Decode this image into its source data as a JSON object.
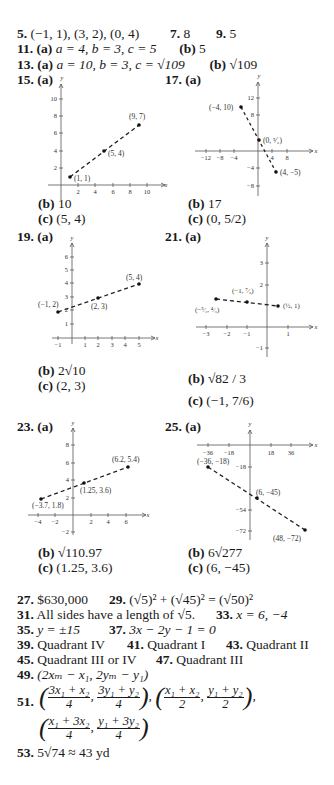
{
  "answers": {
    "a5": {
      "num": "5.",
      "text": "(−1, 1), (3, 2), (0, 4)"
    },
    "a7": {
      "num": "7.",
      "text": "8"
    },
    "a9": {
      "num": "9.",
      "text": "5"
    },
    "a11": {
      "num": "11.",
      "a_label": "(a)",
      "a_text": "a = 4, b = 3, c = 5",
      "b_label": "(b)",
      "b_text": "5"
    },
    "a13": {
      "num": "13.",
      "a_label": "(a)",
      "a_text": "a = 10, b = 3, c = √109",
      "b_label": "(b)",
      "b_text": "√109"
    },
    "a15": {
      "num": "15.",
      "a_label": "(a)",
      "b_label": "(b)",
      "b_text": "10",
      "c_label": "(c)",
      "c_text": "(5, 4)"
    },
    "a17": {
      "num": "17.",
      "a_label": "(a)",
      "b_label": "(b)",
      "b_text": "17",
      "c_label": "(c)",
      "c_text": "(0, 5/2)"
    },
    "a19": {
      "num": "19.",
      "a_label": "(a)",
      "b_label": "(b)",
      "b_text": "2√10",
      "c_label": "(c)",
      "c_text": "(2, 3)"
    },
    "a21": {
      "num": "21.",
      "a_label": "(a)",
      "b_label": "(b)",
      "b_text": "√82 / 3",
      "c_label": "(c)",
      "c_text": "(−1, 7/6)"
    },
    "a23": {
      "num": "23.",
      "a_label": "(a)",
      "b_label": "(b)",
      "b_text": "√110.97",
      "c_label": "(c)",
      "c_text": "(1.25, 3.6)"
    },
    "a25": {
      "num": "25.",
      "a_label": "(a)",
      "b_label": "(b)",
      "b_text": "6√277",
      "c_label": "(c)",
      "c_text": "(6, −45)"
    },
    "a27": {
      "num": "27.",
      "text": "$630,000"
    },
    "a29": {
      "num": "29.",
      "text": "(√5)² + (√45)² = (√50)²"
    },
    "a31": {
      "num": "31.",
      "text": "All sides have a length of √5."
    },
    "a33": {
      "num": "33.",
      "text": "x = 6, −4"
    },
    "a35": {
      "num": "35.",
      "text": "y = ±15"
    },
    "a37": {
      "num": "37.",
      "text": "3x − 2y − 1 = 0"
    },
    "a39": {
      "num": "39.",
      "text": "Quadrant IV"
    },
    "a41": {
      "num": "41.",
      "text": "Quadrant I"
    },
    "a43": {
      "num": "43.",
      "text": "Quadrant II"
    },
    "a45": {
      "num": "45.",
      "text": "Quadrant III or IV"
    },
    "a47": {
      "num": "47.",
      "text": "Quadrant III"
    },
    "a49": {
      "num": "49.",
      "text": "(2xₘ − x₁, 2yₘ − y₁)"
    },
    "a51": {
      "num": "51.",
      "text": "((3x₁ + x₂)/4, (3y₁ + y₂)/4), ((x₁ + x₂)/2, (y₁ + y₂)/2), ((x₁ + 3x₂)/4, (y₁ + 3y₂)/4)"
    },
    "a53": {
      "num": "53.",
      "text": "5√74 ≈ 43 yd"
    }
  },
  "graphs": {
    "g15": {
      "points": [
        "(1, 1)",
        "(5, 4)",
        "(9, 7)"
      ],
      "xticks": [
        "2",
        "4",
        "6",
        "8",
        "10"
      ],
      "yticks": [
        "2",
        "4",
        "6",
        "8",
        "10"
      ],
      "xaxis": "x",
      "yaxis": "y"
    },
    "g17": {
      "points": [
        "(−4, 10)",
        "(0, 5/2)",
        "(4, −5)"
      ],
      "xticks": [
        "−12",
        "−8",
        "−4",
        "4",
        "8"
      ],
      "yticks": [
        "12",
        "8",
        "−4",
        "−8"
      ],
      "xaxis": "x",
      "yaxis": "y"
    },
    "g19": {
      "points": [
        "(−1, 2)",
        "(2, 3)",
        "(5, 4)"
      ],
      "xticks": [
        "−1",
        "1",
        "2",
        "3",
        "4",
        "5"
      ],
      "yticks": [
        "1",
        "2",
        "3",
        "4",
        "5",
        "6"
      ],
      "xaxis": "x",
      "yaxis": "y"
    },
    "g21": {
      "points": [
        "(−5/2, 4/3)",
        "(−1, 7/6)",
        "(1/2, 1)"
      ],
      "xticks": [
        "−3",
        "−2",
        "−1",
        "1"
      ],
      "yticks": [
        "3",
        "2",
        "−1"
      ],
      "xaxis": "x",
      "yaxis": "y"
    },
    "g23": {
      "points": [
        "(−3.7, 1.8)",
        "(1.25, 3.6)",
        "(6.2, 5.4)"
      ],
      "xticks": [
        "−4",
        "−2",
        "2",
        "4",
        "6"
      ],
      "yticks": [
        "8",
        "6",
        "4",
        "2",
        "−2"
      ],
      "xaxis": "x",
      "yaxis": "y"
    },
    "g25": {
      "points": [
        "(−36, −18)",
        "(6, −45)",
        "(48, −72)"
      ],
      "xticks": [
        "−36",
        "−18",
        "18",
        "36"
      ],
      "yticks": [
        "−18",
        "−54",
        "−72"
      ],
      "xaxis": "x",
      "yaxis": "y"
    }
  }
}
